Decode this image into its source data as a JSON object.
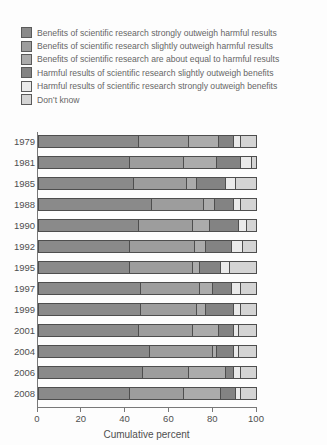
{
  "chart_data": {
    "type": "bar",
    "orientation": "horizontal",
    "stacked": true,
    "title": "",
    "xlabel": "Cumulative percent",
    "xlim": [
      0,
      100
    ],
    "x_ticks": [
      0,
      20,
      40,
      60,
      80,
      100
    ],
    "grid": false,
    "legend_position": "top-left",
    "categories": [
      "1979",
      "1981",
      "1985",
      "1988",
      "1990",
      "1992",
      "1995",
      "1997",
      "1999",
      "2001",
      "2004",
      "2006",
      "2008"
    ],
    "series": [
      {
        "name": "Benefits of scientific research strongly outweigh harmful results",
        "color": "#8a8a8a",
        "values": [
          46,
          42,
          44,
          52,
          46,
          42,
          42,
          47,
          47,
          46,
          51,
          48,
          42
        ]
      },
      {
        "name": "Benefits of scientific research slightly outweigh harmful results",
        "color": "#9d9d9d",
        "values": [
          23,
          25,
          24,
          24,
          25,
          30,
          29,
          27,
          26,
          25,
          29,
          21,
          25
        ]
      },
      {
        "name": "Benefits of scientific research are about equal to harmful results",
        "color": "#ababab",
        "values": [
          14,
          15,
          5,
          5,
          8,
          5,
          3,
          6,
          4,
          12,
          2,
          17,
          17
        ]
      },
      {
        "name": "Harmful results of scientific research slightly outweigh benefits",
        "color": "#838383",
        "values": [
          7,
          11,
          13,
          9,
          13,
          12,
          10,
          9,
          13,
          7,
          8,
          4,
          7
        ]
      },
      {
        "name": "Harmful results of scientific research strongly outweigh benefits",
        "color": "#eaeaea",
        "values": [
          3,
          5,
          5,
          3,
          4,
          5,
          4,
          4,
          3,
          2,
          2,
          3,
          2
        ]
      },
      {
        "name": "Don’t know",
        "color": "#d4d4d4",
        "values": [
          7,
          2,
          9,
          7,
          4,
          6,
          12,
          7,
          7,
          8,
          8,
          7,
          7
        ]
      }
    ],
    "segment_border_color": "#4e4e4e",
    "axis_color": "#787878",
    "hatch_segment": {
      "category": "2008",
      "series_index": 1,
      "style": "horizontal-lines"
    }
  }
}
